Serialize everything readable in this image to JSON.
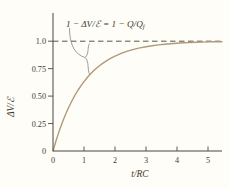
{
  "figure_title": "RC circuit capacitor charging curve",
  "colors": {
    "background": "#fffdf7",
    "axis": "#4a473f",
    "curve": "#af9a7c",
    "dashed_asymptote": "#57544b",
    "text": "#3e3b33",
    "annotation_line": "#8a857a"
  },
  "chart_data": {
    "type": "line",
    "title": "",
    "xlabel": "t/RC",
    "ylabel": "ΔV/ℰ",
    "xlim": [
      0,
      5.45
    ],
    "ylim": [
      0,
      1.1
    ],
    "grid": false,
    "legend": null,
    "asymptote": 1.0,
    "x_ticks": {
      "values": [
        0,
        1,
        2,
        3,
        4,
        5
      ],
      "labels": [
        "0",
        "1",
        "2",
        "3",
        "4",
        "5"
      ]
    },
    "y_ticks": {
      "values": [
        0,
        0.25,
        0.5,
        0.75,
        1.0
      ],
      "labels": [
        "0",
        "0.25",
        "0.50",
        "0.75",
        "1.0"
      ]
    },
    "annotation": {
      "text": "1 − ΔV/ℰ = 1 − Q/Q",
      "subscript": "f"
    },
    "series": [
      {
        "name": "ΔV/ℰ = 1 − e^(−t/RC)",
        "x": [
          0.0,
          0.1,
          0.2,
          0.3,
          0.4,
          0.5,
          0.6,
          0.7,
          0.8,
          0.9,
          1.0,
          1.1,
          1.2,
          1.3,
          1.4,
          1.5,
          1.6,
          1.7,
          1.8,
          1.9,
          2.0,
          2.2,
          2.4,
          2.6,
          2.8,
          3.0,
          3.2,
          3.4,
          3.6,
          3.8,
          4.0,
          4.2,
          4.4,
          4.6,
          4.8,
          5.0,
          5.2,
          5.45
        ],
        "y": [
          0.0,
          0.0952,
          0.1813,
          0.2592,
          0.3297,
          0.3935,
          0.4512,
          0.5034,
          0.5507,
          0.5934,
          0.6321,
          0.6671,
          0.6988,
          0.7275,
          0.7534,
          0.7769,
          0.7981,
          0.8173,
          0.8347,
          0.8504,
          0.8647,
          0.8892,
          0.9093,
          0.9257,
          0.9392,
          0.9502,
          0.9592,
          0.9666,
          0.9727,
          0.9776,
          0.9817,
          0.985,
          0.9877,
          0.9899,
          0.9918,
          0.9933,
          0.9945,
          0.9957
        ]
      }
    ]
  }
}
